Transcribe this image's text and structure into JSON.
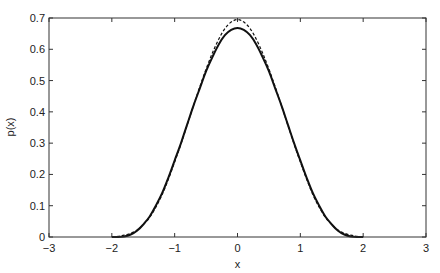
{
  "chart_data": {
    "type": "line",
    "title": "",
    "xlabel": "x",
    "ylabel": "p(x)",
    "xlim": [
      -3,
      3
    ],
    "ylim": [
      0,
      0.7
    ],
    "xticks": [
      -3,
      -2,
      -1,
      0,
      1,
      2,
      3
    ],
    "xtick_labels": [
      "−3",
      "−2",
      "−1",
      "0",
      "1",
      "2",
      "3"
    ],
    "yticks": [
      0,
      0.1,
      0.2,
      0.3,
      0.4,
      0.5,
      0.6,
      0.7
    ],
    "ytick_labels": [
      "0",
      "0.1",
      "0.2",
      "0.3",
      "0.4",
      "0.5",
      "0.6",
      "0.7"
    ],
    "grid": false,
    "legend": null,
    "x": [
      -2.0,
      -1.9,
      -1.8,
      -1.7,
      -1.6,
      -1.5,
      -1.4,
      -1.3,
      -1.2,
      -1.1,
      -1.0,
      -0.9,
      -0.8,
      -0.7,
      -0.6,
      -0.5,
      -0.4,
      -0.3,
      -0.2,
      -0.1,
      0.0,
      0.1,
      0.2,
      0.3,
      0.4,
      0.5,
      0.6,
      0.7,
      0.8,
      0.9,
      1.0,
      1.1,
      1.2,
      1.3,
      1.4,
      1.5,
      1.6,
      1.7,
      1.8,
      1.9,
      2.0
    ],
    "series": [
      {
        "name": "solid",
        "style": "solid",
        "color": "#111111",
        "values": [
          0.0,
          0.0,
          0.002,
          0.008,
          0.02,
          0.04,
          0.065,
          0.1,
          0.14,
          0.19,
          0.245,
          0.3,
          0.36,
          0.42,
          0.475,
          0.53,
          0.575,
          0.615,
          0.645,
          0.662,
          0.668,
          0.662,
          0.645,
          0.615,
          0.575,
          0.53,
          0.475,
          0.42,
          0.36,
          0.3,
          0.245,
          0.19,
          0.14,
          0.1,
          0.065,
          0.04,
          0.02,
          0.008,
          0.002,
          0.0,
          0.0
        ]
      },
      {
        "name": "dashed",
        "style": "dashed",
        "color": "#111111",
        "values": [
          0.0,
          0.002,
          0.006,
          0.012,
          0.022,
          0.04,
          0.062,
          0.095,
          0.135,
          0.185,
          0.24,
          0.297,
          0.358,
          0.42,
          0.48,
          0.537,
          0.588,
          0.632,
          0.666,
          0.687,
          0.695,
          0.687,
          0.666,
          0.632,
          0.588,
          0.537,
          0.48,
          0.42,
          0.358,
          0.297,
          0.24,
          0.185,
          0.135,
          0.095,
          0.062,
          0.04,
          0.022,
          0.012,
          0.006,
          0.002,
          0.0
        ]
      }
    ]
  }
}
